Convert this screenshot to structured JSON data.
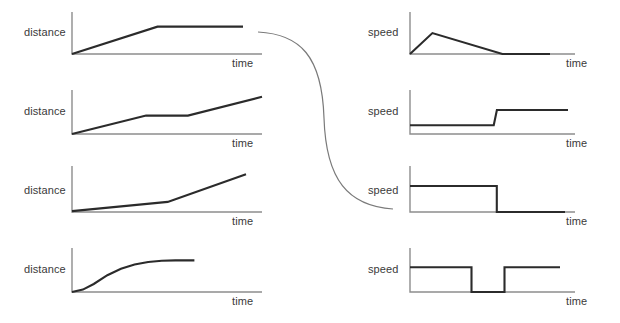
{
  "canvas": {
    "width": 620,
    "height": 323,
    "background": "#ffffff"
  },
  "style": {
    "axis_color": "#8d8d8d",
    "data_color": "#2b2b2b",
    "label_color": "#3a3a3a",
    "connector_color": "#7a7a7a"
  },
  "labels": {
    "distance": "distance",
    "speed": "speed",
    "time": "time"
  },
  "connector": {
    "name": "matching-curve",
    "from": [
      258,
      32
    ],
    "to": [
      393,
      209
    ],
    "path": "M258,32 C300,34 322,56 324,118 C326,180 348,206 393,209"
  },
  "chart_data": [
    {
      "id": "distance-1",
      "type": "line",
      "title": "",
      "ylabel": "distance",
      "xlabel": "time",
      "xlim": [
        0,
        100
      ],
      "ylim": [
        0,
        100
      ],
      "grid": false,
      "legend": "none",
      "description": "Constant speed then stationary: distance rises linearly then stays flat.",
      "points": [
        [
          0,
          0
        ],
        [
          50,
          72
        ],
        [
          100,
          72
        ]
      ]
    },
    {
      "id": "distance-2",
      "type": "line",
      "title": "",
      "ylabel": "distance",
      "xlabel": "time",
      "xlim": [
        0,
        100
      ],
      "ylim": [
        0,
        100
      ],
      "grid": false,
      "legend": "none",
      "description": "Moves, stops for a while, then moves again at the same speed.",
      "points": [
        [
          0,
          0
        ],
        [
          39,
          46
        ],
        [
          61,
          46
        ],
        [
          100,
          93
        ]
      ]
    },
    {
      "id": "distance-3",
      "type": "line",
      "title": "",
      "ylabel": "distance",
      "xlabel": "time",
      "xlim": [
        0,
        100
      ],
      "ylim": [
        0,
        100
      ],
      "grid": false,
      "legend": "none",
      "description": "Slow constant speed then a faster constant speed: shallow line then steeper line.",
      "points": [
        [
          0,
          2
        ],
        [
          55,
          24
        ],
        [
          100,
          90
        ]
      ]
    },
    {
      "id": "distance-4",
      "type": "line",
      "title": "",
      "ylabel": "distance",
      "xlabel": "time",
      "xlim": [
        0,
        100
      ],
      "ylim": [
        0,
        100
      ],
      "grid": false,
      "legend": "none",
      "description": "Speeds up then gradually slows to a stop: S-shaped curve flattening out.",
      "points": [
        [
          0,
          0
        ],
        [
          8,
          6
        ],
        [
          16,
          20
        ],
        [
          26,
          42
        ],
        [
          36,
          58
        ],
        [
          46,
          69
        ],
        [
          56,
          75
        ],
        [
          66,
          78
        ],
        [
          76,
          79
        ],
        [
          90,
          79
        ]
      ]
    },
    {
      "id": "speed-1",
      "type": "line",
      "title": "",
      "ylabel": "speed",
      "xlabel": "time",
      "xlim": [
        0,
        100
      ],
      "ylim": [
        0,
        100
      ],
      "grid": false,
      "legend": "none",
      "description": "Accelerates to a peak, decelerates to zero, then stays at rest.",
      "points": [
        [
          0,
          0
        ],
        [
          16,
          55
        ],
        [
          66,
          0
        ],
        [
          100,
          0
        ]
      ]
    },
    {
      "id": "speed-2",
      "type": "line",
      "title": "",
      "ylabel": "speed",
      "xlabel": "time",
      "xlim": [
        0,
        100
      ],
      "ylim": [
        0,
        100
      ],
      "grid": false,
      "legend": "none",
      "description": "Low constant speed then a sudden step up to a higher constant speed.",
      "points": [
        [
          0,
          22
        ],
        [
          53,
          22
        ],
        [
          55,
          60
        ],
        [
          100,
          60
        ]
      ]
    },
    {
      "id": "speed-3",
      "type": "line",
      "title": "",
      "ylabel": "speed",
      "xlabel": "time",
      "xlim": [
        0,
        100
      ],
      "ylim": [
        0,
        100
      ],
      "grid": false,
      "legend": "none",
      "description": "Constant speed then an abrupt drop to zero and stays at rest.",
      "points": [
        [
          0,
          62
        ],
        [
          56,
          62
        ],
        [
          56,
          0
        ],
        [
          100,
          0
        ]
      ]
    },
    {
      "id": "speed-4",
      "type": "line",
      "title": "",
      "ylabel": "speed",
      "xlabel": "time",
      "xlim": [
        0,
        100
      ],
      "ylim": [
        0,
        100
      ],
      "grid": false,
      "legend": "none",
      "description": "Constant speed, a stop, then the same constant speed again.",
      "points": [
        [
          0,
          62
        ],
        [
          41,
          62
        ],
        [
          41,
          0
        ],
        [
          63,
          0
        ],
        [
          63,
          62
        ],
        [
          100,
          62
        ]
      ]
    }
  ],
  "panels": [
    {
      "name": "distance-chart-1",
      "chart": 0,
      "x": 72,
      "y": 12,
      "w": 190,
      "h": 42,
      "data_end_x": 171,
      "label_y_x": 24,
      "label_y_y": 26,
      "label_x_x": 232,
      "label_x_y": 57
    },
    {
      "name": "distance-chart-2",
      "chart": 1,
      "x": 72,
      "y": 90,
      "w": 190,
      "h": 44,
      "data_end_x": 190,
      "label_y_x": 24,
      "label_y_y": 105,
      "label_x_x": 232,
      "label_x_y": 137
    },
    {
      "name": "distance-chart-3",
      "chart": 2,
      "x": 72,
      "y": 166,
      "w": 190,
      "h": 46,
      "data_end_x": 174,
      "label_y_x": 24,
      "label_y_y": 184,
      "label_x_x": 232,
      "label_x_y": 215
    },
    {
      "name": "distance-chart-4",
      "chart": 3,
      "x": 72,
      "y": 248,
      "w": 190,
      "h": 44,
      "data_end_x": 136,
      "label_y_x": 24,
      "label_y_y": 263,
      "label_x_x": 232,
      "label_x_y": 295
    },
    {
      "name": "speed-chart-1",
      "chart": 4,
      "x": 410,
      "y": 12,
      "w": 165,
      "h": 42,
      "data_end_x": 140,
      "label_y_x": 368,
      "label_y_y": 26,
      "label_x_x": 566,
      "label_x_y": 57
    },
    {
      "name": "speed-chart-2",
      "chart": 5,
      "x": 410,
      "y": 90,
      "w": 165,
      "h": 44,
      "data_end_x": 158,
      "label_y_x": 368,
      "label_y_y": 105,
      "label_x_x": 566,
      "label_x_y": 137
    },
    {
      "name": "speed-chart-3",
      "chart": 6,
      "x": 410,
      "y": 166,
      "w": 165,
      "h": 46,
      "data_end_x": 155,
      "label_y_x": 368,
      "label_y_y": 184,
      "label_x_x": 566,
      "label_x_y": 215
    },
    {
      "name": "speed-chart-4",
      "chart": 7,
      "x": 410,
      "y": 248,
      "w": 165,
      "h": 44,
      "data_end_x": 150,
      "label_y_x": 368,
      "label_y_y": 263,
      "label_x_x": 566,
      "label_x_y": 295
    }
  ]
}
